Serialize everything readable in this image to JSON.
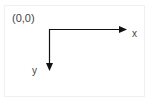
{
  "diagram": {
    "origin_label": "(0,0)",
    "x_axis_label": "x",
    "y_axis_label": "y",
    "axis_color": "#111111",
    "label_color": "#444444"
  }
}
